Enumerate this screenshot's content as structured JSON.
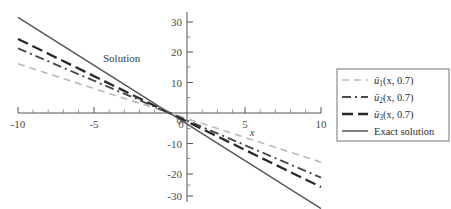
{
  "chart_data": {
    "type": "line",
    "title": "",
    "annotation": "Solution",
    "xlabel": "x",
    "ylabel": "",
    "xlim": [
      -10,
      10
    ],
    "ylim": [
      -33,
      33
    ],
    "xticks": [
      -10,
      -5,
      0,
      5,
      10
    ],
    "xticklabels": [
      "-10",
      "-5",
      "0",
      "5",
      "10"
    ],
    "yticks": [
      30,
      20,
      10,
      0,
      -10,
      -20,
      -30
    ],
    "yticklabels": [
      "30",
      "20",
      "10",
      "0",
      "-10",
      "-20",
      "-30"
    ],
    "grid": false,
    "minor_ticks": true,
    "legend_position": "right",
    "series": [
      {
        "name": "u1",
        "legend_label": "ū₁(x, 0.7)",
        "label_base": "ū",
        "label_sub": "1",
        "label_args": "(x, 0.7)",
        "linestyle": "dashed",
        "color": "#b9b9b9",
        "width": 1.6,
        "dasharray": "7,5",
        "x": [
          -10,
          10
        ],
        "y": [
          16.2,
          -16.2
        ],
        "slope": -1.62
      },
      {
        "name": "u2",
        "legend_label": "ū₂(x, 0.7)",
        "label_base": "ū",
        "label_sub": "2",
        "label_args": "(x, 0.7)",
        "linestyle": "dashdot",
        "color": "#4a4a4a",
        "width": 1.9,
        "dasharray": "9,4,2,4",
        "x": [
          -10,
          10
        ],
        "y": [
          21.3,
          -21.3
        ],
        "slope": -2.13
      },
      {
        "name": "u3",
        "legend_label": "ū₃(x, 0.7)",
        "label_base": "ū",
        "label_sub": "3",
        "label_args": "(x, 0.7)",
        "linestyle": "dashed-long",
        "color": "#2a2a2a",
        "width": 2.3,
        "dasharray": "11,5",
        "x": [
          -10,
          10
        ],
        "y": [
          24.4,
          -24.4
        ],
        "slope": -2.44
      },
      {
        "name": "exact",
        "legend_label": "Exact solution",
        "label_base": "Exact solution",
        "label_sub": "",
        "label_args": "",
        "linestyle": "solid",
        "color": "#555555",
        "width": 1.5,
        "dasharray": "",
        "x": [
          -10,
          10
        ],
        "y": [
          31.5,
          -31.5
        ],
        "slope": -3.15
      }
    ]
  },
  "axes": {
    "x_axis_name": "x-axis",
    "y_axis_name": "y-axis"
  },
  "legend": {
    "border_color": "#777777",
    "background": "#ffffff"
  }
}
